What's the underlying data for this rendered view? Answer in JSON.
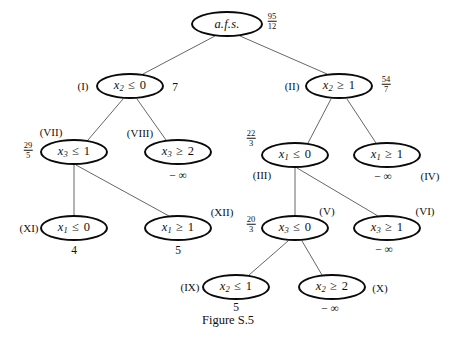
{
  "figure": {
    "caption": "Figure S.5",
    "width": 456,
    "height": 340,
    "background": "#ffffff",
    "stroke_color": "#0a0a0a",
    "edge_color": "#555555"
  },
  "nodes": [
    {
      "id": "root",
      "roman": "",
      "label_text": "a.f.s.",
      "label_parts": {
        "var": "a.f.s.",
        "sub": "",
        "op": "",
        "num": ""
      },
      "value": "",
      "fraction": {
        "numerator": "95",
        "denominator": "12"
      },
      "cx": 227,
      "cy": 24,
      "rx": 36,
      "ry": 13,
      "roman_x": 0,
      "roman_y": 0,
      "value_x": 0,
      "value_y": 0,
      "frac_x": 272,
      "frac_y": 21
    },
    {
      "id": "n1",
      "roman": "(I)",
      "label_text": "x2 <= 0",
      "label_parts": {
        "var": "x",
        "sub": "2",
        "op": "≤",
        "num": "0"
      },
      "value": "7",
      "fraction": null,
      "cx": 130,
      "cy": 86,
      "rx": 34,
      "ry": 13,
      "roman_x": 83,
      "roman_y": 86,
      "value_x": 175,
      "value_y": 87,
      "frac_x": 0,
      "frac_y": 0
    },
    {
      "id": "n2",
      "roman": "(II)",
      "label_text": "x2 >= 1",
      "label_parts": {
        "var": "x",
        "sub": "2",
        "op": "≥",
        "num": "1"
      },
      "value": "",
      "fraction": {
        "numerator": "54",
        "denominator": "7"
      },
      "cx": 339,
      "cy": 86,
      "rx": 34,
      "ry": 13,
      "roman_x": 292,
      "roman_y": 86,
      "value_x": 0,
      "value_y": 0,
      "frac_x": 386,
      "frac_y": 84
    },
    {
      "id": "n7",
      "roman": "(VII)",
      "label_text": "x3 <= 1",
      "label_parts": {
        "var": "x",
        "sub": "3",
        "op": "≤",
        "num": "1"
      },
      "value": "",
      "fraction": {
        "numerator": "29",
        "denominator": "5"
      },
      "cx": 74,
      "cy": 152,
      "rx": 34,
      "ry": 13,
      "roman_x": 51,
      "roman_y": 132,
      "value_x": 0,
      "value_y": 0,
      "frac_x": 28,
      "frac_y": 150
    },
    {
      "id": "n8",
      "roman": "(VIII)",
      "label_text": "x3 >= 2",
      "label_parts": {
        "var": "x",
        "sub": "3",
        "op": "≥",
        "num": "2"
      },
      "value": "− ∞",
      "fraction": null,
      "cx": 178,
      "cy": 152,
      "rx": 34,
      "ry": 13,
      "roman_x": 140,
      "roman_y": 133,
      "value_x": 178,
      "value_y": 175,
      "frac_x": 0,
      "frac_y": 0
    },
    {
      "id": "n3",
      "roman": "(III)",
      "label_text": "x1 <= 0",
      "label_parts": {
        "var": "x",
        "sub": "1",
        "op": "≤",
        "num": "0"
      },
      "value": "",
      "fraction": {
        "numerator": "22",
        "denominator": "3"
      },
      "cx": 295,
      "cy": 155,
      "rx": 34,
      "ry": 13,
      "roman_x": 262,
      "roman_y": 175,
      "value_x": 0,
      "value_y": 0,
      "frac_x": 251,
      "frac_y": 138
    },
    {
      "id": "n4",
      "roman": "(IV)",
      "label_text": "x1 >= 1",
      "label_parts": {
        "var": "x",
        "sub": "1",
        "op": "≥",
        "num": "1"
      },
      "value": "− ∞",
      "fraction": null,
      "cx": 387,
      "cy": 155,
      "rx": 34,
      "ry": 13,
      "roman_x": 430,
      "roman_y": 176,
      "value_x": 383,
      "value_y": 176,
      "frac_x": 0,
      "frac_y": 0
    },
    {
      "id": "n11",
      "roman": "(XI)",
      "label_text": "x1 <= 0",
      "label_parts": {
        "var": "x",
        "sub": "1",
        "op": "≤",
        "num": "0"
      },
      "value": "4",
      "fraction": null,
      "cx": 74,
      "cy": 228,
      "rx": 34,
      "ry": 13,
      "roman_x": 29,
      "roman_y": 228,
      "value_x": 74,
      "value_y": 250,
      "frac_x": 0,
      "frac_y": 0
    },
    {
      "id": "n12",
      "roman": "(XII)",
      "label_text": "x1 >= 1",
      "label_parts": {
        "var": "x",
        "sub": "1",
        "op": "≥",
        "num": "1"
      },
      "value": "5",
      "fraction": null,
      "cx": 178,
      "cy": 228,
      "rx": 34,
      "ry": 13,
      "roman_x": 222,
      "roman_y": 212,
      "value_x": 178,
      "value_y": 250,
      "frac_x": 0,
      "frac_y": 0
    },
    {
      "id": "n5",
      "roman": "(V)",
      "label_text": "x3 <= 0",
      "label_parts": {
        "var": "x",
        "sub": "3",
        "op": "≤",
        "num": "0"
      },
      "value": "",
      "fraction": {
        "numerator": "20",
        "denominator": "3"
      },
      "cx": 295,
      "cy": 228,
      "rx": 34,
      "ry": 13,
      "roman_x": 327,
      "roman_y": 211,
      "value_x": 0,
      "value_y": 0,
      "frac_x": 251,
      "frac_y": 224
    },
    {
      "id": "n6",
      "roman": "(VI)",
      "label_text": "x3 >= 1",
      "label_parts": {
        "var": "x",
        "sub": "3",
        "op": "≥",
        "num": "1"
      },
      "value": "− ∞",
      "fraction": null,
      "cx": 387,
      "cy": 228,
      "rx": 34,
      "ry": 13,
      "roman_x": 425,
      "roman_y": 211,
      "value_x": 384,
      "value_y": 249,
      "frac_x": 0,
      "frac_y": 0
    },
    {
      "id": "n9",
      "roman": "(IX)",
      "label_text": "x2 <= 1",
      "label_parts": {
        "var": "x",
        "sub": "2",
        "op": "≤",
        "num": "1"
      },
      "value": "5",
      "fraction": null,
      "cx": 236,
      "cy": 287,
      "rx": 34,
      "ry": 13,
      "roman_x": 190,
      "roman_y": 287,
      "value_x": 236,
      "value_y": 307,
      "frac_x": 0,
      "frac_y": 0
    },
    {
      "id": "n10",
      "roman": "(X)",
      "label_text": "x2 >= 2",
      "label_parts": {
        "var": "x",
        "sub": "2",
        "op": "≥",
        "num": "2"
      },
      "value": "− ∞",
      "fraction": null,
      "cx": 332,
      "cy": 287,
      "rx": 34,
      "ry": 13,
      "roman_x": 380,
      "roman_y": 288,
      "value_x": 330,
      "value_y": 308,
      "frac_x": 0,
      "frac_y": 0
    }
  ],
  "edges": [
    {
      "from": "root",
      "to": "n1",
      "x1": 215,
      "y1": 36,
      "x2": 143,
      "y2": 74
    },
    {
      "from": "root",
      "to": "n2",
      "x1": 240,
      "y1": 36,
      "x2": 327,
      "y2": 74
    },
    {
      "from": "n1",
      "to": "n7",
      "x1": 123,
      "y1": 99,
      "x2": 88,
      "y2": 140
    },
    {
      "from": "n1",
      "to": "n8",
      "x1": 137,
      "y1": 99,
      "x2": 166,
      "y2": 140
    },
    {
      "from": "n2",
      "to": "n3",
      "x1": 331,
      "y1": 99,
      "x2": 308,
      "y2": 143
    },
    {
      "from": "n2",
      "to": "n4",
      "x1": 347,
      "y1": 99,
      "x2": 376,
      "y2": 143
    },
    {
      "from": "n7",
      "to": "n11",
      "x1": 74,
      "y1": 165,
      "x2": 74,
      "y2": 215
    },
    {
      "from": "n7",
      "to": "n12",
      "x1": 76,
      "y1": 165,
      "x2": 169,
      "y2": 216
    },
    {
      "from": "n3",
      "to": "n5",
      "x1": 295,
      "y1": 168,
      "x2": 295,
      "y2": 215
    },
    {
      "from": "n3",
      "to": "n6",
      "x1": 297,
      "y1": 168,
      "x2": 378,
      "y2": 216
    },
    {
      "from": "n5",
      "to": "n9",
      "x1": 288,
      "y1": 241,
      "x2": 249,
      "y2": 275
    },
    {
      "from": "n5",
      "to": "n10",
      "x1": 302,
      "y1": 241,
      "x2": 322,
      "y2": 275
    }
  ]
}
